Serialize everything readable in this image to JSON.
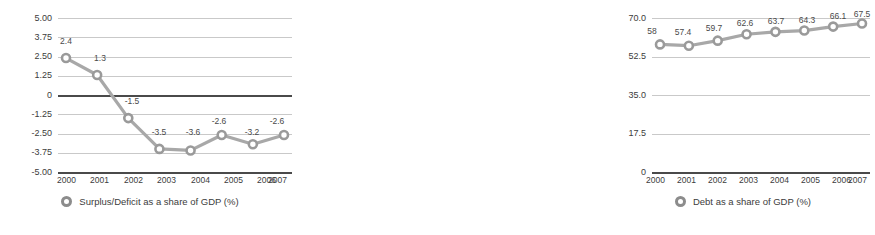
{
  "chart_data": [
    {
      "type": "line",
      "title": "",
      "panel": "left",
      "xlabel": "",
      "ylabel": "",
      "categories": [
        "2000",
        "2001",
        "2002",
        "2003",
        "2004",
        "2005",
        "2006",
        "2007"
      ],
      "values": [
        2.4,
        1.3,
        -1.5,
        -3.5,
        -3.6,
        -2.6,
        -3.2,
        -2.6
      ],
      "value_labels": [
        "2.4",
        "1.3",
        "-1.5",
        "-3.5",
        "-3.6",
        "-2.6",
        "-3.2",
        "-2.6"
      ],
      "ylim": [
        -5.0,
        5.0
      ],
      "yticks": [
        5.0,
        3.75,
        2.5,
        1.25,
        0,
        -1.25,
        -2.5,
        -3.75,
        -5.0
      ],
      "ytick_labels": [
        "5.00",
        "3.75",
        "2.50",
        "1.25",
        "0",
        "-1.25",
        "-2.50",
        "-3.75",
        "-5.00"
      ],
      "emphasized_gridlines": [
        0,
        -5.0
      ],
      "grid": true,
      "legend_position": "bottom",
      "legend": [
        "Surplus/Deficit as a share of GDP (%)"
      ],
      "series_color": "#a8a8a8",
      "marker_color": "#9a9a9a"
    },
    {
      "type": "line",
      "title": "",
      "panel": "right",
      "xlabel": "",
      "ylabel": "",
      "categories": [
        "2000",
        "2001",
        "2002",
        "2003",
        "2004",
        "2005",
        "2006",
        "2007"
      ],
      "values": [
        58,
        57.4,
        59.7,
        62.6,
        63.7,
        64.3,
        66.1,
        67.5
      ],
      "value_labels": [
        "58",
        "57.4",
        "59.7",
        "62.6",
        "63.7",
        "64.3",
        "66.1",
        "67.5"
      ],
      "ylim": [
        0,
        70.0
      ],
      "yticks": [
        70.0,
        52.5,
        35.0,
        17.5,
        0
      ],
      "ytick_labels": [
        "70.0",
        "52.5",
        "35.0",
        "17.5",
        "0"
      ],
      "emphasized_gridlines": [
        0
      ],
      "grid": true,
      "legend_position": "bottom",
      "legend": [
        "Debt as a share of GDP (%)"
      ],
      "series_color": "#a8a8a8",
      "marker_color": "#9a9a9a"
    }
  ],
  "left": {
    "legend_label": "Surplus/Deficit as a share of GDP (%)",
    "ytick_labels": [
      "5.00",
      "3.75",
      "2.50",
      "1.25",
      "0",
      "-1.25",
      "-2.50",
      "-3.75",
      "-5.00"
    ],
    "xtick_labels": [
      "2000",
      "2001",
      "2002",
      "2003",
      "2004",
      "2005",
      "2006",
      "2007"
    ],
    "value_labels": [
      "2.4",
      "1.3",
      "-1.5",
      "-3.5",
      "-3.6",
      "-2.6",
      "-3.2",
      "-2.6"
    ]
  },
  "right": {
    "legend_label": "Debt as a share of GDP (%)",
    "ytick_labels": [
      "70.0",
      "52.5",
      "35.0",
      "17.5",
      "0"
    ],
    "xtick_labels": [
      "2000",
      "2001",
      "2002",
      "2003",
      "2004",
      "2005",
      "2006",
      "2007"
    ],
    "value_labels": [
      "58",
      "57.4",
      "59.7",
      "62.6",
      "63.7",
      "64.3",
      "66.1",
      "67.5"
    ]
  },
  "colors": {
    "series": "#a8a8a8",
    "marker_stroke": "#9a9a9a",
    "grid": "#c9c9c9",
    "axis_strong": "#4a4a4a",
    "text": "#3c3c3c",
    "background": "#ffffff"
  }
}
